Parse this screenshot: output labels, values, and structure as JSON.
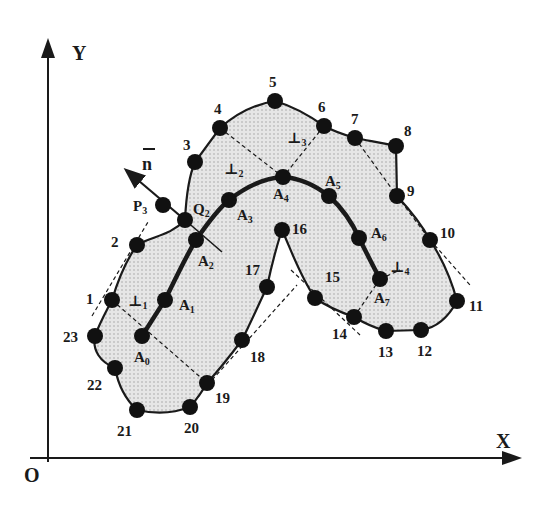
{
  "axes": {
    "x_label": "X",
    "y_label": "Y",
    "origin_label": "O"
  },
  "normal_vector_label": "n",
  "colors": {
    "ink": "#1a1a1a",
    "fill": "#d9d9d9",
    "dots": "#cfcfcf"
  },
  "boundary_points": [
    {
      "id": "1",
      "x": 112,
      "y": 300
    },
    {
      "id": "2",
      "x": 137,
      "y": 245
    },
    {
      "id": "3",
      "x": 195,
      "y": 162
    },
    {
      "id": "4",
      "x": 220,
      "y": 128
    },
    {
      "id": "5",
      "x": 275,
      "y": 101
    },
    {
      "id": "6",
      "x": 324,
      "y": 126
    },
    {
      "id": "7",
      "x": 355,
      "y": 138
    },
    {
      "id": "8",
      "x": 396,
      "y": 146
    },
    {
      "id": "9",
      "x": 397,
      "y": 196
    },
    {
      "id": "10",
      "x": 430,
      "y": 240
    },
    {
      "id": "11",
      "x": 457,
      "y": 301
    },
    {
      "id": "12",
      "x": 421,
      "y": 330
    },
    {
      "id": "13",
      "x": 386,
      "y": 331
    },
    {
      "id": "14",
      "x": 354,
      "y": 317
    },
    {
      "id": "15",
      "x": 315,
      "y": 298
    },
    {
      "id": "16",
      "x": 282,
      "y": 230
    },
    {
      "id": "17",
      "x": 267,
      "y": 287
    },
    {
      "id": "18",
      "x": 242,
      "y": 340
    },
    {
      "id": "19",
      "x": 207,
      "y": 383
    },
    {
      "id": "20",
      "x": 190,
      "y": 407
    },
    {
      "id": "21",
      "x": 137,
      "y": 410
    },
    {
      "id": "22",
      "x": 115,
      "y": 368
    },
    {
      "id": "23",
      "x": 95,
      "y": 336
    }
  ],
  "medial_points": [
    {
      "id": "A",
      "sub": "0",
      "x": 142,
      "y": 336
    },
    {
      "id": "A",
      "sub": "1",
      "x": 165,
      "y": 300
    },
    {
      "id": "A",
      "sub": "2",
      "x": 196,
      "y": 240
    },
    {
      "id": "A",
      "sub": "3",
      "x": 229,
      "y": 200
    },
    {
      "id": "A",
      "sub": "4",
      "x": 283,
      "y": 177
    },
    {
      "id": "A",
      "sub": "5",
      "x": 329,
      "y": 196
    },
    {
      "id": "A",
      "sub": "6",
      "x": 359,
      "y": 238
    },
    {
      "id": "A",
      "sub": "7",
      "x": 380,
      "y": 279
    }
  ],
  "special_points": [
    {
      "id": "P",
      "sub": "3",
      "x": 163,
      "y": 205
    },
    {
      "id": "Q",
      "sub": "2",
      "x": 185,
      "y": 220
    }
  ],
  "perpendicular_labels": [
    {
      "sub": "1",
      "x": 128,
      "y": 306
    },
    {
      "sub": "2",
      "x": 224,
      "y": 174
    },
    {
      "sub": "3",
      "x": 287,
      "y": 143
    },
    {
      "sub": "4",
      "x": 390,
      "y": 272
    }
  ]
}
